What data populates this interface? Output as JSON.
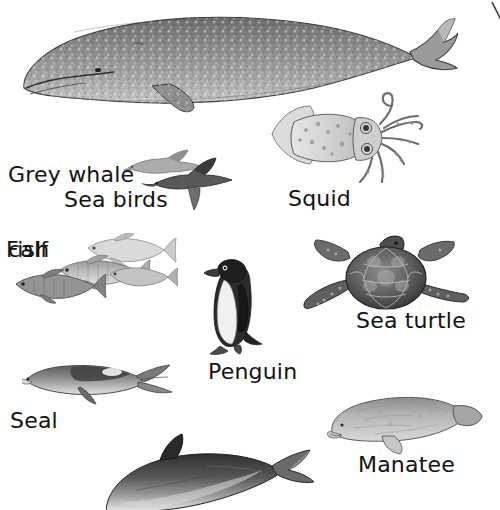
{
  "page": {
    "background_color": "#ffffff",
    "width": 500,
    "height": 510,
    "style": "grayscale pencil / engraving style illustrations with handwritten-style labels"
  },
  "labels": [
    {
      "id": "grey-whale-calf",
      "text": "Grey whale\ncalf",
      "line1": "Grey whale",
      "line2": "calf",
      "x": 8,
      "y": 112
    },
    {
      "id": "sea-birds",
      "text": "Sea birds",
      "x": 64,
      "y": 187
    },
    {
      "id": "squid",
      "text": "Squid",
      "x": 288,
      "y": 186
    },
    {
      "id": "fish",
      "text": "Fish",
      "x": 6,
      "y": 237
    },
    {
      "id": "sea-turtle",
      "text": "Sea turtle",
      "x": 356,
      "y": 308
    },
    {
      "id": "penguin",
      "text": "Penguin",
      "x": 208,
      "y": 359
    },
    {
      "id": "seal",
      "text": "Seal",
      "x": 10,
      "y": 408
    },
    {
      "id": "manatee",
      "text": "Manatee",
      "x": 358,
      "y": 452
    }
  ],
  "figures": [
    {
      "id": "grey-whale-calf",
      "name": "grey whale calf",
      "x": 14,
      "y": 2,
      "w": 444,
      "h": 112
    },
    {
      "id": "sea-birds",
      "name": "sea birds",
      "x": 124,
      "y": 142,
      "w": 110,
      "h": 72
    },
    {
      "id": "squid",
      "name": "squid",
      "x": 266,
      "y": 92,
      "w": 158,
      "h": 94
    },
    {
      "id": "fish",
      "name": "fish",
      "x": 14,
      "y": 232,
      "w": 164,
      "h": 76
    },
    {
      "id": "sea-turtle",
      "name": "sea turtle",
      "x": 300,
      "y": 234,
      "w": 172,
      "h": 86
    },
    {
      "id": "penguin",
      "name": "penguin",
      "x": 200,
      "y": 258,
      "w": 64,
      "h": 98
    },
    {
      "id": "seal",
      "name": "seal",
      "x": 22,
      "y": 358,
      "w": 152,
      "h": 48
    },
    {
      "id": "manatee",
      "name": "manatee",
      "x": 320,
      "y": 390,
      "w": 164,
      "h": 66
    },
    {
      "id": "dolphin",
      "name": "dolphin",
      "x": 106,
      "y": 432,
      "w": 216,
      "h": 78
    }
  ],
  "decoration": {
    "corner_stroke": "thin diagonal line, top-right corner"
  },
  "colors": {
    "background": "#ffffff",
    "text": "#111111",
    "illustration_dark": "#2b2b2b",
    "illustration_mid": "#8a8a8a",
    "illustration_light": "#cfcfcf"
  }
}
